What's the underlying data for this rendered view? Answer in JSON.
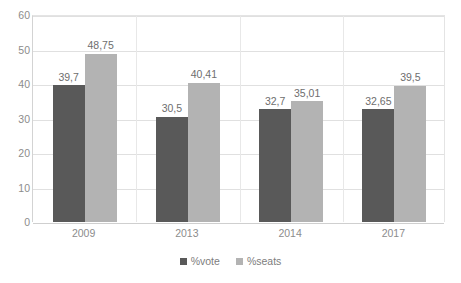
{
  "chart_data": {
    "type": "bar",
    "title": "",
    "subtitle": "",
    "xlabel": "",
    "ylabel": "",
    "categories": [
      "2009",
      "2013",
      "2014",
      "2017"
    ],
    "series": [
      {
        "name": "%vote",
        "color": "#595959",
        "values": [
          39.7,
          30.5,
          32.7,
          32.65
        ],
        "labels": [
          "39,7",
          "30,5",
          "32,7",
          "32,65"
        ]
      },
      {
        "name": "%seats",
        "color": "#b3b3b3",
        "values": [
          48.75,
          40.41,
          35.01,
          39.5
        ],
        "labels": [
          "48,75",
          "40,41",
          "35,01",
          "39,5"
        ]
      }
    ],
    "ylim": [
      0,
      60
    ],
    "ytick_step": 10,
    "yticks": [
      "0",
      "10",
      "20",
      "30",
      "40",
      "50",
      "60"
    ],
    "grid": true,
    "grid_axis": "y",
    "legend_position": "bottom",
    "decimal_separator": ","
  },
  "legend": {
    "items": [
      {
        "label": "%vote",
        "color": "#595959"
      },
      {
        "label": "%seats",
        "color": "#b3b3b3"
      }
    ]
  },
  "colors": {
    "vote": "#595959",
    "seats": "#b3b3b3",
    "grid": "#e0e0e0",
    "axis_text": "#8c8c8c",
    "label_text": "#6e6e6e",
    "background": "#ffffff"
  }
}
